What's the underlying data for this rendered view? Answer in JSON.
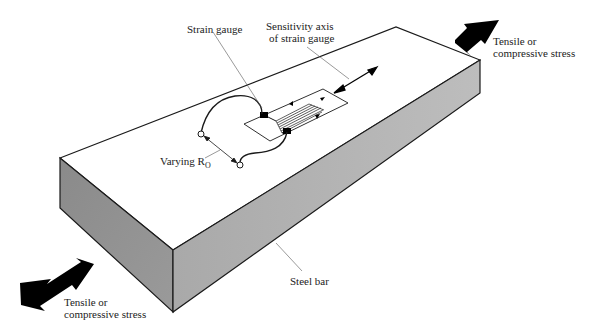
{
  "diagram": {
    "labels": {
      "strain_gauge": "Strain gauge",
      "sensitivity_axis_line1": "Sensitivity axis",
      "sensitivity_axis_line2": "of strain gauge",
      "stress_right_line1": "Tensile or",
      "stress_right_line2": "compressive stress",
      "stress_left_line1": "Tensile or",
      "stress_left_line2": "compressive stress",
      "varying_r": "Varying R",
      "varying_r_subscript": "O",
      "steel_bar": "Steel bar"
    },
    "colors": {
      "top_face": "#ffffff",
      "left_end_face": "#8f8f8f",
      "front_face": "#b4b4b4",
      "outline": "#1a1a1a",
      "arrows": "#000000"
    }
  }
}
